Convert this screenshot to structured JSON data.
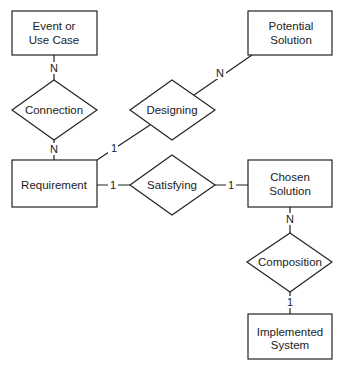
{
  "diagram": {
    "type": "entity-relationship",
    "entities": {
      "event": {
        "line1": "Event or",
        "line2": "Use Case"
      },
      "requirement": {
        "label": "Requirement"
      },
      "potential": {
        "line1": "Potential",
        "line2": "Solution"
      },
      "chosen": {
        "line1": "Chosen",
        "line2": "Solution"
      },
      "implemented": {
        "line1": "Implemented",
        "line2": "System"
      }
    },
    "relationships": {
      "connection": {
        "label": "Connection"
      },
      "designing": {
        "label": "Designing"
      },
      "satisfying": {
        "label": "Satisfying"
      },
      "composition": {
        "label": "Composition"
      }
    },
    "cardinalities": {
      "event_connection": "N",
      "connection_requirement": "N",
      "requirement_designing": "1",
      "designing_potential": "N",
      "requirement_satisfying": "1",
      "satisfying_chosen": "1",
      "chosen_composition": "N",
      "composition_implemented": "1"
    }
  }
}
